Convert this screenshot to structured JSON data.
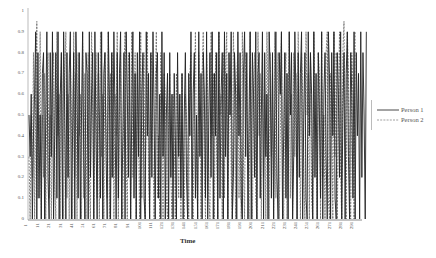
{
  "chart_data": {
    "type": "line",
    "title": "",
    "xlabel": "Time",
    "ylabel": "",
    "ylim": [
      0,
      1
    ],
    "xlim": [
      1,
      300
    ],
    "grid": false,
    "legend_position": "right",
    "y_ticks": [
      "1",
      "0.9",
      "0.8",
      "0.7",
      "0.6",
      "0.5",
      "0.4",
      "0.3",
      "0.2",
      "0.1",
      "0"
    ],
    "x_ticks": [
      "1",
      "11",
      "21",
      "31",
      "41",
      "51",
      "61",
      "71",
      "81",
      "91",
      "101",
      "111",
      "121",
      "131",
      "141",
      "151",
      "161",
      "171",
      "181",
      "191",
      "201",
      "211",
      "221",
      "231",
      "241",
      "251",
      "261",
      "271",
      "281",
      "291"
    ],
    "series": [
      {
        "name": "Person 1",
        "style": "solid",
        "color": "#222222",
        "values": [
          0.5,
          0.3,
          0.6,
          0.0,
          0.4,
          0.6,
          0.9,
          0.0,
          0.8,
          0.1,
          0.5,
          0.0,
          0.7,
          0.8,
          0.0,
          0.5,
          0.9,
          0.2,
          0.0,
          0.8,
          0.3,
          0.9,
          0.0,
          0.4,
          0.8,
          0.1,
          0.9,
          0.0,
          0.6,
          0.8,
          0.0,
          0.9,
          0.5,
          0.0,
          0.8,
          0.2,
          0.7,
          0.9,
          0.0,
          0.4,
          0.8,
          0.0,
          0.9,
          0.6,
          0.1,
          0.8,
          0.0,
          0.5,
          0.9,
          0.3,
          0.0,
          0.8,
          0.7,
          0.0,
          0.9,
          0.2,
          0.6,
          0.8,
          0.0,
          0.9,
          0.4,
          0.0,
          0.8,
          0.5,
          0.1,
          0.9,
          0.0,
          0.7,
          0.8,
          0.3,
          0.0,
          0.9,
          0.6,
          0.0,
          0.8,
          0.2,
          0.9,
          0.5,
          0.0,
          0.8,
          0.1,
          0.7,
          0.9,
          0.0,
          0.4,
          0.8,
          0.0,
          0.9,
          0.6,
          0.2,
          0.8,
          0.0,
          0.5,
          0.9,
          0.1,
          0.7,
          0.0,
          0.8,
          0.3,
          0.9,
          0.0,
          0.6,
          0.8,
          0.1,
          0.0,
          0.9,
          0.4,
          0.7,
          0.0,
          0.8,
          0.2,
          0.9,
          0.5,
          0.0,
          0.7,
          0.8,
          0.1,
          0.6,
          0.0,
          0.9,
          0.3,
          0.8,
          0.0,
          0.5,
          0.7,
          0.0,
          0.8,
          0.2,
          0.6,
          0.0,
          0.7,
          0.4,
          0.0,
          0.8,
          0.3,
          0.6,
          0.1,
          0.7,
          0.0,
          0.5,
          0.8,
          0.2,
          0.0,
          0.7,
          0.4,
          0.9,
          0.0,
          0.6,
          0.8,
          0.1,
          0.5,
          0.0,
          0.9,
          0.3,
          0.7,
          0.0,
          0.8,
          0.6,
          0.1,
          0.9,
          0.0,
          0.5,
          0.8,
          0.2,
          0.9,
          0.0,
          0.7,
          0.4,
          0.8,
          0.0,
          0.9,
          0.1,
          0.6,
          0.8,
          0.0,
          0.9,
          0.3,
          0.7,
          0.0,
          0.8,
          0.5,
          0.9,
          0.0,
          0.2,
          0.8,
          0.6,
          0.0,
          0.9,
          0.4,
          0.8,
          0.1,
          0.0,
          0.7,
          0.9,
          0.3,
          0.8,
          0.0,
          0.5,
          0.9,
          0.0,
          0.8,
          0.6,
          0.2,
          0.9,
          0.0,
          0.7,
          0.8,
          0.1,
          0.5,
          0.9,
          0.0,
          0.8,
          0.3,
          0.6,
          0.0,
          0.9,
          0.7,
          0.1,
          0.8,
          0.0,
          0.5,
          0.9,
          0.2,
          0.0,
          0.8,
          0.6,
          0.9,
          0.0,
          0.4,
          0.8,
          0.1,
          0.7,
          0.0,
          0.9,
          0.5,
          0.8,
          0.0,
          0.3,
          0.9,
          0.6,
          0.0,
          0.8,
          0.2,
          0.7,
          0.9,
          0.0,
          0.5,
          0.8,
          0.1,
          0.0,
          0.9,
          0.4,
          0.8,
          0.6,
          0.0,
          0.9,
          0.2,
          0.7,
          0.0,
          0.8,
          0.5,
          0.1,
          0.9,
          0.0,
          0.6,
          0.8,
          0.3,
          0.0,
          0.9,
          0.7,
          0.0,
          0.8,
          0.4,
          0.9,
          0.1,
          0.0,
          0.8,
          0.6,
          0.2,
          0.9,
          0.0,
          0.5,
          0.8,
          0.0,
          0.7,
          0.9,
          0.3,
          0.0,
          0.8,
          0.6,
          0.1,
          0.9,
          0.0,
          0.8,
          0.4,
          0.7,
          0.0,
          0.9,
          0.2,
          0.8,
          0.5,
          0.0,
          0.9
        ]
      },
      {
        "name": "Person 2",
        "style": "dashed",
        "color": "#555555",
        "values": [
          0.3,
          0.0,
          0.5,
          0.2,
          0.8,
          0.0,
          0.6,
          0.95,
          0.1,
          0.4,
          0.9,
          0.0,
          0.5,
          0.2,
          0.7,
          0.0,
          0.6,
          0.8,
          0.1,
          0.5,
          0.0,
          0.7,
          0.8,
          0.2,
          0.0,
          0.9,
          0.4,
          0.6,
          0.0,
          0.8,
          0.3,
          0.0,
          0.7,
          0.9,
          0.1,
          0.6,
          0.0,
          0.8,
          0.5,
          0.0,
          0.9,
          0.2,
          0.7,
          0.0,
          0.8,
          0.4,
          0.6,
          0.0,
          0.9,
          0.1,
          0.7,
          0.0,
          0.5,
          0.8,
          0.2,
          0.0,
          0.9,
          0.6,
          0.0,
          0.4,
          0.8,
          0.1,
          0.7,
          0.0,
          0.9,
          0.3,
          0.6,
          0.0,
          0.8,
          0.5,
          0.1,
          0.9,
          0.0,
          0.7,
          0.2,
          0.8,
          0.0,
          0.6,
          0.4,
          0.9,
          0.0,
          0.5,
          0.8,
          0.1,
          0.0,
          0.7,
          0.9,
          0.3,
          0.0,
          0.8,
          0.6,
          0.0,
          0.9,
          0.2,
          0.5,
          0.8,
          0.0,
          0.7,
          0.4,
          0.0,
          0.9,
          0.1,
          0.6,
          0.8,
          0.0,
          0.5,
          0.9,
          0.2,
          0.0,
          0.7,
          0.8,
          0.3,
          0.0,
          0.6,
          0.9,
          0.1,
          0.4,
          0.0,
          0.8,
          0.5,
          0.0,
          0.7,
          0.6,
          0.1,
          0.0,
          0.5,
          0.7,
          0.2,
          0.0,
          0.6,
          0.4,
          0.0,
          0.7,
          0.5,
          0.1,
          0.6,
          0.0,
          0.7,
          0.3,
          0.0,
          0.6,
          0.5,
          0.2,
          0.0,
          0.7,
          0.8,
          0.1,
          0.0,
          0.6,
          0.9,
          0.3,
          0.0,
          0.8,
          0.5,
          0.0,
          0.7,
          0.9,
          0.2,
          0.0,
          0.8,
          0.6,
          0.1,
          0.0,
          0.9,
          0.4,
          0.7,
          0.0,
          0.8,
          0.3,
          0.0,
          0.9,
          0.5,
          0.6,
          0.0,
          0.8,
          0.1,
          0.7,
          0.9,
          0.0,
          0.4,
          0.8,
          0.2,
          0.0,
          0.9,
          0.6,
          0.0,
          0.7,
          0.8,
          0.1,
          0.5,
          0.0,
          0.9,
          0.3,
          0.0,
          0.8,
          0.7,
          0.2,
          0.0,
          0.9,
          0.5,
          0.0,
          0.6,
          0.8,
          0.1,
          0.0,
          0.9,
          0.4,
          0.7,
          0.0,
          0.8,
          0.2,
          0.6,
          0.0,
          0.9,
          0.5,
          0.0,
          0.8,
          0.3,
          0.7,
          0.0,
          0.9,
          0.1,
          0.6,
          0.8,
          0.0,
          0.4,
          0.9,
          0.2,
          0.0,
          0.7,
          0.8,
          0.0,
          0.5,
          0.9,
          0.1,
          0.6,
          0.0,
          0.8,
          0.3,
          0.7,
          0.0,
          0.9,
          0.4,
          0.0,
          0.8,
          0.6,
          0.2,
          0.0,
          0.9,
          0.5,
          0.7,
          0.0,
          0.8,
          0.1,
          0.0,
          0.9,
          0.6,
          0.3,
          0.0,
          0.8,
          0.7,
          0.0,
          0.9,
          0.2,
          0.5,
          0.0,
          0.8,
          0.9,
          0.1,
          0.0,
          0.7,
          0.6,
          0.0,
          0.9,
          0.3,
          0.8,
          0.0,
          0.5,
          0.9,
          0.2,
          0.0,
          0.8,
          0.95,
          0.4,
          0.0,
          0.9,
          0.7,
          0.1,
          0.0,
          0.8,
          0.6,
          0.0,
          0.9
        ]
      }
    ]
  },
  "legend": {
    "items": [
      {
        "label": "Person 1",
        "style": "solid"
      },
      {
        "label": "Person 2",
        "style": "dashed"
      }
    ]
  }
}
